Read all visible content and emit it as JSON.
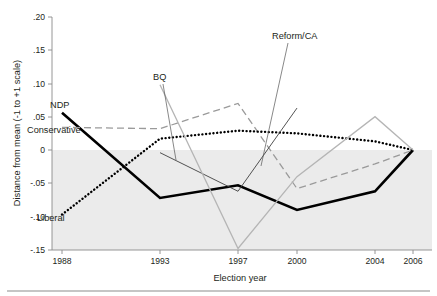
{
  "chart_data": {
    "type": "line",
    "title": "",
    "xlabel": "Election year",
    "ylabel": "Distance from mean (-1 to +1 scale)",
    "x": [
      1988,
      1993,
      1997,
      2000,
      2004,
      2006
    ],
    "xtick_labels": [
      "1988",
      "1993",
      "1997",
      "2000",
      "2004",
      "2006"
    ],
    "ytick_labels": [
      ".20",
      ".15",
      ".10",
      ".05",
      "0",
      "-.05",
      "-.10",
      "-.15"
    ],
    "ytick_values": [
      0.2,
      0.15,
      0.1,
      0.05,
      0.0,
      -0.05,
      -0.1,
      -0.15
    ],
    "ylim": [
      -0.15,
      0.2
    ],
    "xlim": [
      1988,
      2006
    ],
    "grid": false,
    "legend_position": "inline-annotations",
    "shaded_region": {
      "from": 0.0,
      "to": -0.15,
      "color": "#ebebeb"
    },
    "series": [
      {
        "name": "NDP",
        "style": "solid-thick",
        "color": "#000000",
        "x": [
          1988,
          1993,
          1997,
          2000,
          2004,
          2006
        ],
        "values": [
          0.056,
          -0.072,
          -0.053,
          -0.09,
          -0.062,
          0.0
        ]
      },
      {
        "name": "Conservative",
        "style": "dashed",
        "color": "#9a9a9a",
        "x": [
          1988,
          1993,
          1997,
          2000,
          2004,
          2006
        ],
        "values": [
          0.034,
          0.032,
          0.07,
          -0.058,
          -0.021,
          0.0
        ]
      },
      {
        "name": "Liberal",
        "style": "dotted",
        "color": "#000000",
        "x": [
          1988,
          1993,
          1997,
          2000,
          2004,
          2006
        ],
        "values": [
          -0.097,
          0.017,
          0.029,
          0.025,
          0.013,
          0.0
        ]
      },
      {
        "name": "Reform/CA",
        "style": "solid-thin",
        "color": "#3f3f3f",
        "x": [
          1993,
          1997,
          2000
        ],
        "values": [
          -0.004,
          -0.062,
          0.063
        ]
      },
      {
        "name": "BQ",
        "style": "solid-light",
        "color": "#b5b5b5",
        "x": [
          1993,
          1997,
          2000,
          2004,
          2006
        ],
        "values": [
          0.098,
          -0.148,
          -0.04,
          0.05,
          0.0
        ]
      }
    ],
    "annotations": [
      {
        "text": "NDP",
        "x": 50,
        "y": 108,
        "anchor": "start"
      },
      {
        "text": "Conservative",
        "x": 27,
        "y": 133,
        "anchor": "start"
      },
      {
        "text": "Liberal",
        "x": 37,
        "y": 221,
        "anchor": "start"
      },
      {
        "text": "BQ",
        "x": 153,
        "y": 80,
        "anchor": "start"
      },
      {
        "text": "Reform/CA",
        "x": 272,
        "y": 39,
        "anchor": "start"
      }
    ]
  }
}
